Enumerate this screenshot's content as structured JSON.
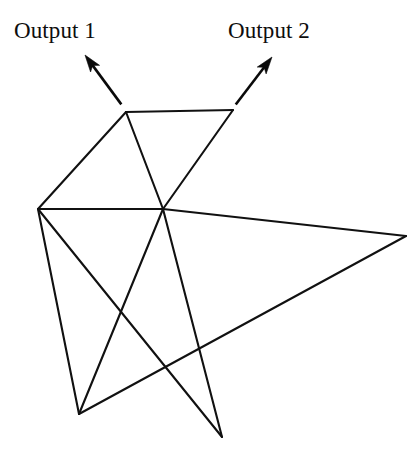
{
  "figure": {
    "width": 419,
    "height": 458,
    "background_color": "#ffffff",
    "line_color": "#111111",
    "text_color": "#0d0d0d",
    "labels": [
      {
        "id": "output-1",
        "text": "Output 1",
        "x": 14,
        "y": 19
      },
      {
        "id": "output-2",
        "text": "Output 2",
        "x": 228,
        "y": 19
      }
    ],
    "vertices": [
      {
        "id": "TL",
        "name": "top-left-node",
        "x": 126,
        "y": 112
      },
      {
        "id": "TR",
        "name": "top-right-node",
        "x": 233,
        "y": 110
      },
      {
        "id": "L",
        "name": "left-hub-node",
        "x": 38,
        "y": 209
      },
      {
        "id": "C",
        "name": "center-hub-node",
        "x": 163,
        "y": 209
      },
      {
        "id": "R",
        "name": "far-right-node",
        "x": 406,
        "y": 236
      },
      {
        "id": "BL",
        "name": "bottom-left-node",
        "x": 79,
        "y": 414
      },
      {
        "id": "BR",
        "name": "bottom-right-node",
        "x": 222,
        "y": 437
      }
    ],
    "edges": [
      {
        "from": "TL",
        "to": "TR"
      },
      {
        "from": "TL",
        "to": "L"
      },
      {
        "from": "TL",
        "to": "C"
      },
      {
        "from": "TR",
        "to": "C"
      },
      {
        "from": "L",
        "to": "C"
      },
      {
        "from": "C",
        "to": "R"
      },
      {
        "from": "L",
        "to": "BL"
      },
      {
        "from": "L",
        "to": "BR"
      },
      {
        "from": "C",
        "to": "BL"
      },
      {
        "from": "C",
        "to": "BR"
      },
      {
        "from": "BL",
        "to": "R"
      }
    ],
    "pointers": [
      {
        "id": "pointer-output-1",
        "name": "output-1-arrow",
        "label_ref": "output-1",
        "tail_x": 124,
        "tail_y": 108,
        "tip_x": 85,
        "tip_y": 55,
        "direction": "up-left"
      },
      {
        "id": "pointer-output-2",
        "name": "output-2-arrow",
        "label_ref": "output-2",
        "tail_x": 233,
        "tail_y": 108,
        "tip_x": 272,
        "tip_y": 57,
        "direction": "up-right"
      }
    ]
  }
}
